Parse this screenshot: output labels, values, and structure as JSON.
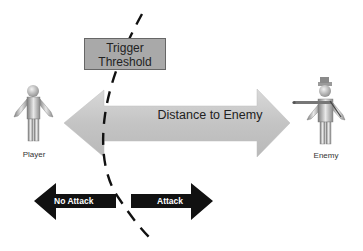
{
  "diagram": {
    "threshold_label_line1": "Trigger",
    "threshold_label_line2": "Threshold",
    "distance_label": "Distance to Enemy",
    "player_label": "Player",
    "enemy_label": "Enemy",
    "no_attack_label": "No Attack",
    "attack_label": "Attack"
  },
  "colors": {
    "distance_arrow": "#c8c8c8",
    "threshold_box": "#a9a9a9",
    "action_arrows": "#111111",
    "dashed_curve": "#111111"
  }
}
